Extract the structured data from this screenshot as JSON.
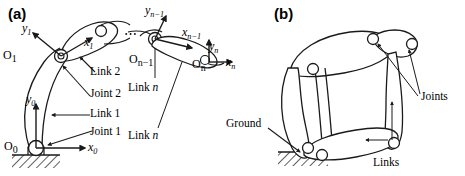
{
  "figure": {
    "panels": [
      {
        "id": "a",
        "id_label": "(a)",
        "caption_role": "open-chain serial manipulator with link coordinate frames"
      },
      {
        "id": "b",
        "id_label": "(b)",
        "caption_role": "closed-loop linkage mechanism"
      }
    ]
  },
  "panel_a": {
    "id_label": "(a)",
    "ellipsis": "⋯",
    "frames": [
      {
        "origin": "O",
        "origin_sub": "0",
        "x_axis": "x",
        "x_sub": "0",
        "y_axis": "y",
        "y_sub": "0"
      },
      {
        "origin": "O",
        "origin_sub": "1",
        "x_axis": "x",
        "x_sub": "1",
        "y_axis": "y",
        "y_sub": "1"
      },
      {
        "origin": "O",
        "origin_sub": "n−1",
        "x_axis": "x",
        "x_sub": "n−1",
        "y_axis": "y",
        "y_sub": "n−1"
      },
      {
        "origin": "O",
        "origin_sub": "n",
        "x_axis": "x",
        "x_sub": "n",
        "y_axis": "y",
        "y_sub": "n"
      }
    ],
    "labels": {
      "origin_0": "O",
      "origin_0_sub": "0",
      "origin_1": "O",
      "origin_1_sub": "1",
      "origin_nm1": "O",
      "origin_nm1_sub": "n−1",
      "origin_n": "O",
      "origin_n_sub": "n",
      "x0": "x",
      "x0_sub": "0",
      "y0": "y",
      "y0_sub": "0",
      "x1": "x",
      "x1_sub": "1",
      "y1": "y",
      "y1_sub": "1",
      "xnm1": "x",
      "xnm1_sub": "n−1",
      "ynm1": "y",
      "ynm1_sub": "n−1",
      "xn": "x",
      "xn_sub": "n",
      "yn": "y",
      "yn_sub": "n",
      "joint1": "Joint 1",
      "joint2": "Joint 2",
      "link1": "Link 1",
      "link2": "Link 2",
      "link_n_upper": "Link ",
      "link_n_upper_it": "n",
      "link_n_lower": "Link ",
      "link_n_lower_it": "n"
    }
  },
  "panel_b": {
    "id_label": "(b)",
    "labels": {
      "ground": "Ground",
      "joints": "Joints",
      "links": "Links"
    }
  },
  "colors": {
    "stroke": "#1a1a1a",
    "fill": "#ffffff",
    "background": "#ffffff",
    "hatch": "#2b2b2b"
  }
}
